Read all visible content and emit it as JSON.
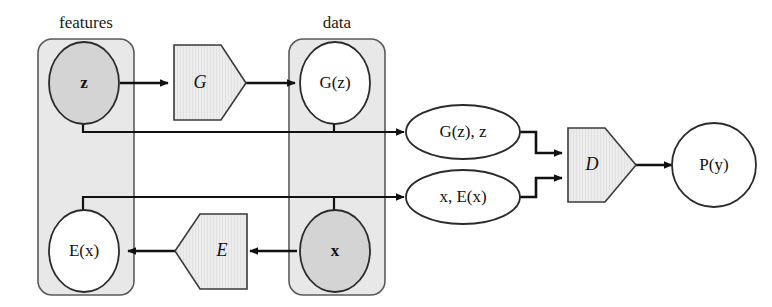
{
  "figure": {
    "type": "diagram",
    "title": ""
  },
  "colors": {
    "plate_fill": "#e8e8e8",
    "plate_stroke": "#5a5a5a",
    "node_filled": "#d4d4d4",
    "node_open": "#ffffff",
    "node_stroke": "#2b2b2b",
    "op_fill": "#ececec",
    "op_stroke": "#3a3a3a",
    "arrow": "#111111",
    "text": "#111111",
    "background": "#ffffff"
  },
  "plates": [
    {
      "id": "features",
      "label": "features"
    },
    {
      "id": "data",
      "label": "data"
    }
  ],
  "nodes": [
    {
      "id": "z",
      "label": "z",
      "style": "filled",
      "shape": "circle",
      "plate": "features"
    },
    {
      "id": "Ex",
      "label": "E(x)",
      "style": "open",
      "shape": "circle",
      "plate": "features"
    },
    {
      "id": "Gz",
      "label": "G(z)",
      "style": "open",
      "shape": "circle",
      "plate": "data"
    },
    {
      "id": "x",
      "label": "x",
      "style": "filled",
      "shape": "circle",
      "plate": "data"
    },
    {
      "id": "Py",
      "label": "P(y)",
      "style": "open",
      "shape": "circle",
      "plate": null
    }
  ],
  "operators": [
    {
      "id": "G",
      "label": "G",
      "shape": "pentagon-right"
    },
    {
      "id": "E",
      "label": "E",
      "shape": "pentagon-left"
    },
    {
      "id": "D",
      "label": "D",
      "shape": "pentagon-right"
    }
  ],
  "pairs": [
    {
      "id": "pair_gz_z",
      "label": "G(z), z",
      "shape": "ellipse"
    },
    {
      "id": "pair_x_ex",
      "label": "x, E(x)",
      "shape": "ellipse"
    }
  ],
  "edges": [
    {
      "from": "z",
      "to": "G",
      "kind": "arrow"
    },
    {
      "from": "G",
      "to": "Gz",
      "kind": "arrow"
    },
    {
      "from": "x",
      "to": "E",
      "kind": "arrow"
    },
    {
      "from": "E",
      "to": "Ex",
      "kind": "arrow"
    },
    {
      "from": "z",
      "to": "pair_gz_z",
      "kind": "elbow-arrow"
    },
    {
      "from": "Gz",
      "to": "pair_gz_z",
      "kind": "stub-join"
    },
    {
      "from": "Ex",
      "to": "pair_x_ex",
      "kind": "elbow-arrow"
    },
    {
      "from": "x",
      "to": "pair_x_ex",
      "kind": "stub-join"
    },
    {
      "from": "pair_gz_z",
      "to": "D",
      "kind": "elbow-arrow"
    },
    {
      "from": "pair_x_ex",
      "to": "D",
      "kind": "elbow-arrow"
    },
    {
      "from": "D",
      "to": "Py",
      "kind": "arrow"
    }
  ]
}
